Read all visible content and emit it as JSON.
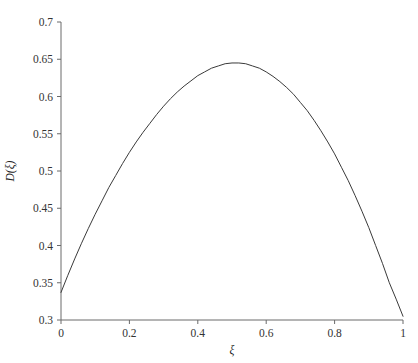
{
  "chart_data": {
    "type": "line",
    "title": "",
    "subtitle": "",
    "xlabel": "ξ",
    "ylabel": "D(ξ)",
    "xlim": [
      0,
      1
    ],
    "ylim": [
      0.3,
      0.7
    ],
    "grid": false,
    "legend": false,
    "legend_position": "none",
    "line_color": "#3a3a3a",
    "axis_color": "#6a6a6a",
    "background_color": "#ffffff",
    "xticks": [
      0,
      0.2,
      0.4,
      0.6,
      0.8,
      1
    ],
    "xtick_labels": [
      "0",
      "0.2",
      "0.4",
      "0.6",
      "0.8",
      "1"
    ],
    "yticks": [
      0.3,
      0.35,
      0.4,
      0.45,
      0.5,
      0.55,
      0.6,
      0.65,
      0.7
    ],
    "ytick_labels": [
      "0.3",
      "0.35",
      "0.4",
      "0.45",
      "0.5",
      "0.55",
      "0.6",
      "0.65",
      "0.7"
    ],
    "series": [
      {
        "name": "D(ξ)",
        "x": [
          0.0,
          0.02,
          0.04,
          0.06,
          0.08,
          0.1,
          0.12,
          0.14,
          0.16,
          0.18,
          0.2,
          0.22,
          0.24,
          0.26,
          0.28,
          0.3,
          0.32,
          0.34,
          0.36,
          0.38,
          0.4,
          0.42,
          0.44,
          0.46,
          0.48,
          0.5,
          0.52,
          0.54,
          0.56,
          0.58,
          0.6,
          0.62,
          0.64,
          0.66,
          0.68,
          0.7,
          0.72,
          0.74,
          0.76,
          0.78,
          0.8,
          0.82,
          0.84,
          0.86,
          0.88,
          0.9,
          0.92,
          0.94,
          0.96,
          0.98,
          1.0
        ],
        "y": [
          0.337,
          0.36,
          0.382,
          0.403,
          0.423,
          0.442,
          0.46,
          0.478,
          0.494,
          0.51,
          0.525,
          0.539,
          0.552,
          0.564,
          0.576,
          0.587,
          0.597,
          0.606,
          0.614,
          0.621,
          0.628,
          0.633,
          0.638,
          0.641,
          0.644,
          0.645,
          0.645,
          0.644,
          0.641,
          0.638,
          0.633,
          0.627,
          0.62,
          0.612,
          0.603,
          0.592,
          0.581,
          0.568,
          0.554,
          0.539,
          0.523,
          0.505,
          0.487,
          0.467,
          0.446,
          0.424,
          0.4,
          0.376,
          0.35,
          0.328,
          0.305
        ]
      }
    ],
    "annotations": []
  }
}
